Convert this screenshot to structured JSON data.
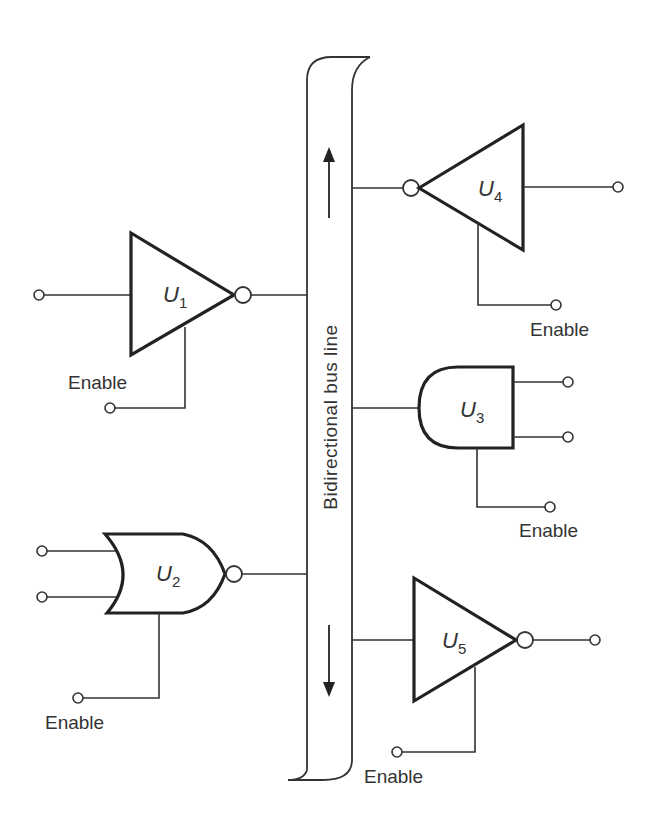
{
  "figure": {
    "type": "tri-state bus logic diagram"
  },
  "bus": {
    "label": "Bidirectional bus line",
    "arrows": [
      "up",
      "down"
    ]
  },
  "gates": [
    {
      "id": "U1",
      "letter": "U",
      "subscript": "1",
      "type": "tri-state inverter",
      "inputs": 1,
      "output_bubble": true,
      "enable_label": "Enable",
      "side": "left"
    },
    {
      "id": "U2",
      "letter": "U",
      "subscript": "2",
      "type": "tri-state NOR",
      "inputs": 2,
      "output_bubble": true,
      "enable_label": "Enable",
      "side": "left"
    },
    {
      "id": "U3",
      "letter": "U",
      "subscript": "3",
      "type": "tri-state AND (receiving)",
      "outputs": 2,
      "enable_label": "Enable",
      "side": "right"
    },
    {
      "id": "U4",
      "letter": "U",
      "subscript": "4",
      "type": "tri-state inverter (receiving)",
      "input_bubble": true,
      "enable_label": "Enable",
      "side": "right"
    },
    {
      "id": "U5",
      "letter": "U",
      "subscript": "5",
      "type": "tri-state inverter (receiving)",
      "output_bubble": true,
      "enable_label": "Enable",
      "side": "right"
    }
  ],
  "labels": {
    "enable": "Enable"
  }
}
